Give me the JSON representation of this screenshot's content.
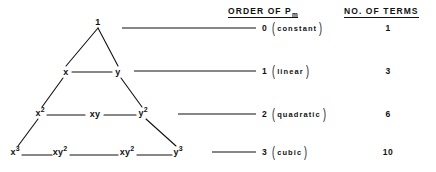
{
  "figure": {
    "background_color": "#ffffff",
    "ink_color": "#111111"
  },
  "headers": {
    "order": {
      "text": "ORDER OF P",
      "subscript": "m",
      "underlined": true
    },
    "terms": {
      "text": "NO. OF TERMS",
      "underlined": true
    }
  },
  "triangle": {
    "rows": [
      {
        "order": 0,
        "nodes": [
          {
            "base": "1",
            "sup": "",
            "x": 98,
            "y": 22
          }
        ]
      },
      {
        "order": 1,
        "nodes": [
          {
            "base": "x",
            "sup": "",
            "x": 66,
            "y": 72
          },
          {
            "base": "y",
            "sup": "",
            "x": 118,
            "y": 72
          }
        ]
      },
      {
        "order": 2,
        "nodes": [
          {
            "base": "x",
            "sup": "2",
            "x": 40,
            "y": 113
          },
          {
            "base": "xy",
            "sup": "",
            "x": 95,
            "y": 114
          },
          {
            "base": "y",
            "sup": "2",
            "x": 143,
            "y": 113
          }
        ]
      },
      {
        "order": 3,
        "nodes": [
          {
            "base": "x",
            "sup": "3",
            "x": 15,
            "y": 152
          },
          {
            "base": "xy",
            "sup": "2",
            "x": 60,
            "y": 152
          },
          {
            "base": "xy",
            "sup": "2",
            "x": 127,
            "y": 152
          },
          {
            "base": "y",
            "sup": "3",
            "x": 178,
            "y": 152
          }
        ]
      }
    ]
  },
  "table": {
    "rows": [
      {
        "order": "0",
        "name": "constant",
        "terms": "1",
        "connector_x1": 122,
        "connector_x2": 256,
        "y": 28
      },
      {
        "order": "1",
        "name": "linear",
        "terms": "3",
        "connector_x1": 134,
        "connector_x2": 256,
        "y": 71
      },
      {
        "order": "2",
        "name": "quadratic",
        "terms": "6",
        "connector_x1": 178,
        "connector_x2": 256,
        "y": 114
      },
      {
        "order": "3",
        "name": "cubic",
        "terms": "10",
        "connector_x1": 212,
        "connector_x2": 256,
        "y": 152
      }
    ],
    "paren_open": "(",
    "paren_close": ")",
    "terms_column_x": 388,
    "order_column_x": 262
  },
  "edges": [
    {
      "x1": 98,
      "y1": 28,
      "x2": 66,
      "y2": 66
    },
    {
      "x1": 98,
      "y1": 28,
      "x2": 118,
      "y2": 66
    },
    {
      "x1": 72,
      "y1": 72,
      "x2": 112,
      "y2": 72
    },
    {
      "x1": 63,
      "y1": 78,
      "x2": 42,
      "y2": 107
    },
    {
      "x1": 121,
      "y1": 78,
      "x2": 142,
      "y2": 107
    },
    {
      "x1": 47,
      "y1": 115,
      "x2": 85,
      "y2": 115
    },
    {
      "x1": 104,
      "y1": 115,
      "x2": 136,
      "y2": 115
    },
    {
      "x1": 38,
      "y1": 119,
      "x2": 18,
      "y2": 146
    },
    {
      "x1": 146,
      "y1": 119,
      "x2": 176,
      "y2": 146
    },
    {
      "x1": 22,
      "y1": 155,
      "x2": 52,
      "y2": 155
    },
    {
      "x1": 70,
      "y1": 155,
      "x2": 118,
      "y2": 155
    },
    {
      "x1": 137,
      "y1": 155,
      "x2": 172,
      "y2": 155
    }
  ]
}
